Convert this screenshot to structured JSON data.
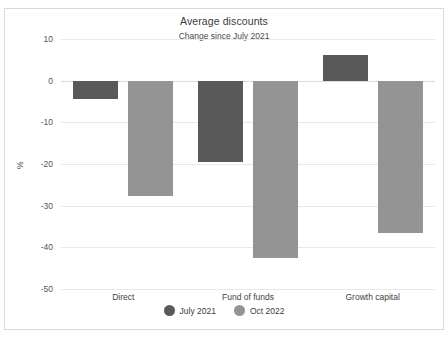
{
  "chart_data": {
    "type": "bar",
    "title": "Average discounts",
    "subtitle": "Change since July 2021",
    "xlabel": "",
    "ylabel": "%",
    "categories": [
      "Direct",
      "Fund of funds",
      "Growth capital"
    ],
    "series": [
      {
        "name": "July 2021",
        "color": "#595959",
        "values": [
          -4.5,
          -19.5,
          6.2
        ]
      },
      {
        "name": "Oct 2022",
        "color": "#949494",
        "values": [
          -27.8,
          -42.5,
          -36.5
        ]
      }
    ],
    "ylim": [
      -50,
      10
    ],
    "yticks": [
      10,
      0,
      -10,
      -20,
      -30,
      -40,
      -50
    ],
    "ytick_labels": [
      "10",
      "0",
      "-10",
      "-20",
      "-30",
      "-40",
      "-50"
    ],
    "grid": true,
    "legend_position": "bottom"
  },
  "legend": {
    "items": [
      {
        "label": "July 2021",
        "color": "#595959"
      },
      {
        "label": "Oct 2022",
        "color": "#949494"
      }
    ]
  }
}
